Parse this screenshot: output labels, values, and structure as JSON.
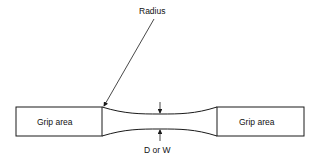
{
  "diagram": {
    "labels": {
      "radius": "Radius",
      "grip_left": "Grip area",
      "grip_right": "Grip area",
      "dimension": "D or W"
    },
    "colors": {
      "stroke": "#1a1a1a",
      "background": "#ffffff"
    }
  }
}
